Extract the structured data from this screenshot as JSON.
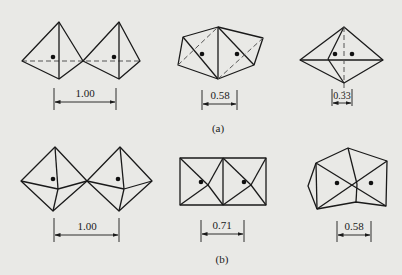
{
  "figure": {
    "panels": [
      {
        "label": "(a)",
        "diagrams": [
          {
            "id": "a1",
            "shape": "two-tetrahedra-point-to-point",
            "dimension": "1.00"
          },
          {
            "id": "a2",
            "shape": "two-tetrahedra-edge-sharing",
            "dimension": "0.58"
          },
          {
            "id": "a3",
            "shape": "two-tetrahedra-face-sharing",
            "dimension": "0.33"
          }
        ]
      },
      {
        "label": "(b)",
        "diagrams": [
          {
            "id": "b1",
            "shape": "two-octahedra-corner-sharing",
            "dimension": "1.00"
          },
          {
            "id": "b2",
            "shape": "two-octahedra-edge-sharing",
            "dimension": "0.71"
          },
          {
            "id": "b3",
            "shape": "two-octahedra-face-sharing",
            "dimension": "0.58"
          }
        ]
      }
    ]
  },
  "colors": {
    "background": "#e9e9e6",
    "line": "#1a1a1a",
    "dashed": "#555555"
  }
}
